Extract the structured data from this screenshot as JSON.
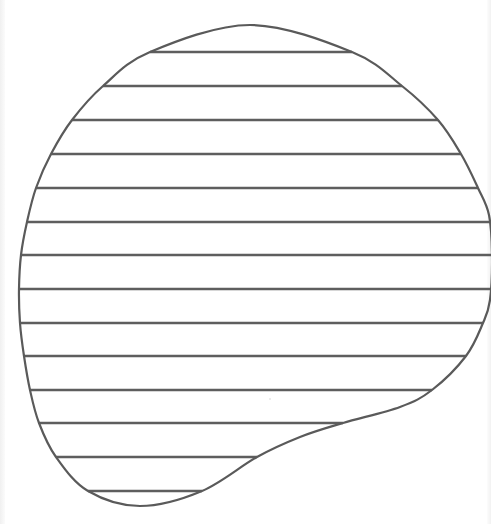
{
  "figure": {
    "stroke_color": "#5a5a5a",
    "background_color": "#ffffff",
    "outline_points": [
      [
        250,
        25
      ],
      [
        352,
        52
      ],
      [
        402,
        86
      ],
      [
        438,
        120
      ],
      [
        461,
        154
      ],
      [
        478,
        188
      ],
      [
        489,
        215
      ],
      [
        492,
        255
      ],
      [
        490,
        300
      ],
      [
        483,
        323
      ],
      [
        466,
        356
      ],
      [
        432,
        390
      ],
      [
        400,
        407
      ],
      [
        343,
        423
      ],
      [
        300,
        437
      ],
      [
        257,
        457
      ],
      [
        202,
        491
      ],
      [
        140,
        506
      ],
      [
        88,
        491
      ],
      [
        56,
        457
      ],
      [
        39,
        423
      ],
      [
        30,
        390
      ],
      [
        24,
        356
      ],
      [
        20,
        323
      ],
      [
        19,
        289
      ],
      [
        21,
        255
      ],
      [
        27,
        222
      ],
      [
        36,
        188
      ],
      [
        51,
        154
      ],
      [
        72,
        120
      ],
      [
        103,
        86
      ],
      [
        150,
        52
      ]
    ],
    "hatch_lines": [
      {
        "y": 52,
        "x1": 150,
        "x2": 352
      },
      {
        "y": 86,
        "x1": 103,
        "x2": 402
      },
      {
        "y": 120,
        "x1": 72,
        "x2": 438
      },
      {
        "y": 154,
        "x1": 51,
        "x2": 461
      },
      {
        "y": 188,
        "x1": 36,
        "x2": 478
      },
      {
        "y": 222,
        "x1": 27,
        "x2": 491
      },
      {
        "y": 255,
        "x1": 21,
        "x2": 491
      },
      {
        "y": 289,
        "x1": 19,
        "x2": 491
      },
      {
        "y": 323,
        "x1": 20,
        "x2": 483
      },
      {
        "y": 356,
        "x1": 24,
        "x2": 466
      },
      {
        "y": 390,
        "x1": 30,
        "x2": 432
      },
      {
        "y": 423,
        "x1": 39,
        "x2": 343
      },
      {
        "y": 457,
        "x1": 56,
        "x2": 257
      },
      {
        "y": 491,
        "x1": 88,
        "x2": 202
      }
    ],
    "hatch_line_count": 14
  }
}
